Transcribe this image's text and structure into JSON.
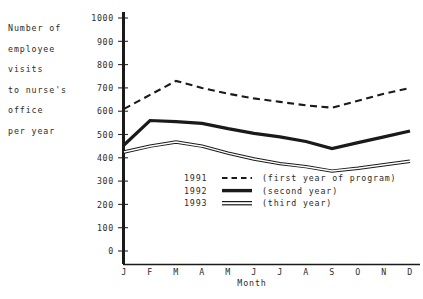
{
  "chart_data": {
    "type": "line",
    "title": "",
    "ylabel": "Number of employee visits to nurse's office per year",
    "ylabel_lines": [
      "Number of",
      "employee",
      "visits",
      "to nurse's",
      "office",
      "per year"
    ],
    "xlabel": "Month",
    "categories": [
      "J",
      "F",
      "M",
      "A",
      "M",
      "J",
      "J",
      "A",
      "S",
      "O",
      "N",
      "D"
    ],
    "category_names": [
      "January",
      "February",
      "March",
      "April",
      "May",
      "June",
      "July",
      "August",
      "September",
      "October",
      "November",
      "December"
    ],
    "yticks": [
      0,
      100,
      200,
      300,
      400,
      500,
      600,
      700,
      800,
      900,
      1000
    ],
    "ylim": [
      0,
      1000
    ],
    "grid": false,
    "legend_position": "inside-lower-center",
    "series": [
      {
        "name": "1991",
        "note": "(first year of program)",
        "style": "dashed",
        "values": [
          610,
          670,
          730,
          700,
          675,
          655,
          640,
          625,
          615,
          645,
          675,
          700
        ]
      },
      {
        "name": "1992",
        "note": "(second year)",
        "style": "thick-solid",
        "values": [
          455,
          560,
          555,
          548,
          525,
          505,
          490,
          470,
          440,
          465,
          490,
          515
        ]
      },
      {
        "name": "1993",
        "note": "(third year)",
        "style": "double",
        "values": [
          425,
          450,
          468,
          450,
          420,
          395,
          375,
          362,
          343,
          355,
          370,
          385
        ]
      }
    ]
  },
  "legend": {
    "rows": [
      {
        "label": "1991",
        "note": "(first year of program)"
      },
      {
        "label": "1992",
        "note": "(second year)"
      },
      {
        "label": "1993",
        "note": "(third year)"
      }
    ]
  },
  "colors": {
    "ink": "#1a1a1a",
    "text": "#2b2b2b",
    "background": "#ffffff"
  }
}
